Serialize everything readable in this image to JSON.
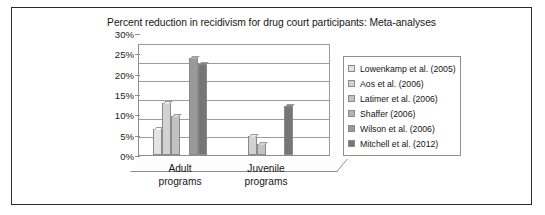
{
  "figure": {
    "title": "Percent reduction in recidivism for drug court participants: Meta-analyses"
  },
  "chart_data": {
    "type": "bar",
    "title": "Percent reduction in recidivism for drug court participants: Meta-analyses",
    "xlabel": "",
    "ylabel": "",
    "categories": [
      "Adult programs",
      "Juvenile programs"
    ],
    "category_lines": [
      [
        "Adult",
        "programs"
      ],
      [
        "Juvenile",
        "programs"
      ]
    ],
    "ylim": [
      0,
      30
    ],
    "ytick_values": [
      0,
      5,
      10,
      15,
      20,
      25,
      30
    ],
    "ytick_labels": [
      "0%",
      "5%",
      "10%",
      "15%",
      "20%",
      "25%",
      "30%"
    ],
    "grid": true,
    "legend_position": "right",
    "series": [
      {
        "name": "Lowenkamp et al. (2005)",
        "color": "#e3e3e3",
        "values": [
          7,
          null
        ]
      },
      {
        "name": "Aos et al. (2006)",
        "color": "#d2d2d2",
        "values": [
          14,
          5
        ]
      },
      {
        "name": "Latimer et al. (2006)",
        "color": "#c2c2c2",
        "values": [
          10.5,
          3
        ]
      },
      {
        "name": "Shaffer (2006)",
        "color": "#b3b3b3",
        "values": [
          null,
          null
        ]
      },
      {
        "name": "Wilson et al. (2006)",
        "color": "#9a9a9a",
        "values": [
          26,
          null
        ]
      },
      {
        "name": "Mitchell et al. (2012)",
        "color": "#767676",
        "values": [
          24.5,
          13
        ]
      }
    ]
  }
}
